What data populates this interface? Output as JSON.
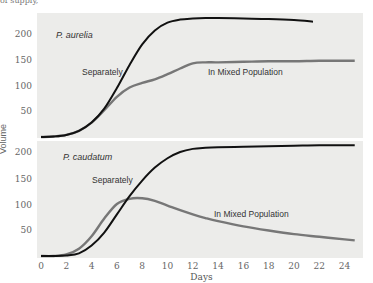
{
  "header": {
    "cut_text": "of supply,"
  },
  "chart_data": [
    {
      "type": "line",
      "title": "P. aurelia",
      "xlabel": "Days",
      "ylabel": "Volume",
      "xlim": [
        0,
        25
      ],
      "ylim": [
        0,
        240
      ],
      "yticks": [
        50,
        100,
        150,
        200
      ],
      "xticks": [
        0,
        2,
        4,
        6,
        8,
        10,
        12,
        14,
        16,
        18,
        20,
        22,
        24
      ],
      "grid": false,
      "series": [
        {
          "name": "Separately",
          "color": "#111111",
          "x": [
            0,
            1,
            2,
            3,
            4,
            5,
            6,
            7,
            8,
            9,
            10,
            11,
            12,
            13,
            14,
            16,
            18,
            20,
            21.5
          ],
          "y": [
            0,
            1,
            4,
            12,
            28,
            55,
            95,
            140,
            180,
            207,
            222,
            228,
            230,
            231,
            231,
            230,
            229,
            227,
            224
          ]
        },
        {
          "name": "In Mixed Population",
          "color": "#777777",
          "x": [
            0,
            1,
            2,
            3,
            4,
            5,
            6,
            7,
            8,
            9,
            10,
            11,
            12,
            13,
            14,
            16,
            18,
            20,
            22,
            24,
            24.8
          ],
          "y": [
            0,
            1,
            4,
            12,
            28,
            52,
            78,
            96,
            105,
            112,
            122,
            133,
            143,
            145,
            145,
            146,
            147,
            147,
            148,
            148,
            148
          ]
        }
      ],
      "annotations": [
        "P. aurelia",
        "Separately",
        "In Mixed Population"
      ]
    },
    {
      "type": "line",
      "title": "P. caudatum",
      "xlabel": "Days",
      "ylabel": "Volume",
      "xlim": [
        0,
        25
      ],
      "ylim": [
        0,
        220
      ],
      "yticks": [
        50,
        100,
        150,
        200
      ],
      "xticks": [
        0,
        2,
        4,
        6,
        8,
        10,
        12,
        14,
        16,
        18,
        20,
        22,
        24
      ],
      "grid": false,
      "series": [
        {
          "name": "Separately",
          "color": "#111111",
          "x": [
            0,
            1,
            2,
            3,
            4,
            5,
            6,
            7,
            8,
            9,
            10,
            11,
            12,
            13,
            14,
            16,
            18,
            20,
            22,
            24,
            24.8
          ],
          "y": [
            0,
            0,
            1,
            5,
            20,
            45,
            80,
            115,
            145,
            170,
            188,
            200,
            206,
            208,
            209,
            210,
            211,
            212,
            213,
            213,
            213
          ]
        },
        {
          "name": "In Mixed Population",
          "color": "#777777",
          "x": [
            0,
            1,
            2,
            3,
            4,
            5,
            6,
            7,
            8,
            9,
            10,
            11,
            12,
            13,
            14,
            16,
            18,
            20,
            22,
            24,
            24.8
          ],
          "y": [
            0,
            0,
            3,
            14,
            38,
            72,
            100,
            110,
            111,
            106,
            97,
            88,
            80,
            73,
            67,
            57,
            49,
            42,
            37,
            32,
            30
          ]
        }
      ],
      "annotations": [
        "P. caudatum",
        "Separately",
        "In Mixed Population"
      ]
    }
  ],
  "labels": {
    "top_panel": "P. aurelia",
    "bottom_panel": "P. caudatum",
    "separately": "Separately",
    "mixed": "In Mixed Population",
    "xlabel": "Days",
    "ylabel": "Volume"
  }
}
